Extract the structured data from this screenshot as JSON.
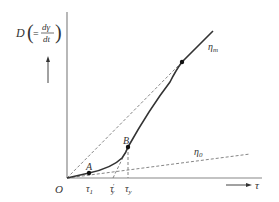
{
  "diagram": {
    "type": "flow-curve",
    "y_axis_label": {
      "main": "D",
      "paren_open": "(",
      "eq": "=",
      "num": "dγ",
      "den": "dt",
      "paren_close": ")"
    },
    "x_axis_label": "τ",
    "origin_label": "O",
    "points": {
      "A": "A",
      "B": "B"
    },
    "tick_labels": [
      "τ₁",
      "τ′ᵧ",
      "τᵧ"
    ],
    "tick_main": [
      "τ",
      "τ",
      "τ"
    ],
    "tick_sub": [
      "1",
      "y",
      "y"
    ],
    "tick_sup": [
      "",
      "′",
      ""
    ],
    "line_labels": {
      "eta_m": "η",
      "eta_m_sub": "m",
      "eta_0": "η",
      "eta_0_sub": "0"
    },
    "colors": {
      "line": "#333333",
      "dashed": "#777777"
    }
  }
}
